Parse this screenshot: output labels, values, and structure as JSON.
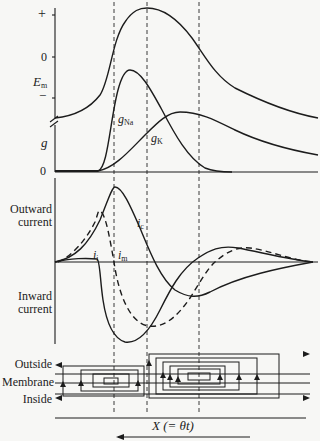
{
  "figure": {
    "top_panel": {
      "y_axis_ticks": [
        "+",
        "0",
        "−"
      ],
      "y_axis_label_em": "E",
      "y_axis_label_em_sub": "m",
      "y_axis_label_g": "g",
      "g_zero_tick": "0",
      "curve_labels": {
        "gna": "g",
        "gna_sub": "Na",
        "gk": "g",
        "gk_sub": "K"
      }
    },
    "middle_panel": {
      "outward_label_line1": "Outward",
      "outward_label_line2": "current",
      "inward_label_line1": "Inward",
      "inward_label_line2": "current",
      "curve_labels": {
        "ii": "i",
        "ii_sub": "i",
        "im": "i",
        "im_sub": "m",
        "ic": "i",
        "ic_sub": "c"
      }
    },
    "bottom_panel": {
      "outside_label": "Outside",
      "membrane_label": "Membrane",
      "inside_label": "Inside"
    },
    "x_axis_label": "X (= θt)",
    "direction_arrow": "leftward"
  },
  "colors": {
    "ink": "#1c1c1c",
    "background": "#f7f7f5",
    "dashed": "#3a3a3a"
  }
}
